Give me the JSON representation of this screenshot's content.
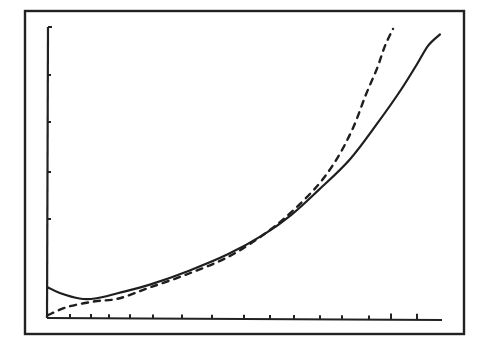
{
  "chart_data": {
    "type": "line",
    "title": "",
    "xlabel": "",
    "ylabel": "",
    "grid": false,
    "legend": null,
    "x_ticks_count": 15,
    "y_ticks_count": 5,
    "xlim": [
      0,
      1
    ],
    "ylim": [
      0,
      1
    ],
    "series": [
      {
        "name": "solid",
        "style": "solid",
        "x": [
          0.0,
          0.03,
          0.08,
          0.12,
          0.18,
          0.26,
          0.36,
          0.46,
          0.55,
          0.62,
          0.69,
          0.77,
          0.84,
          0.9,
          0.94,
          0.97,
          1.0
        ],
        "y": [
          0.11,
          0.09,
          0.07,
          0.07,
          0.09,
          0.12,
          0.17,
          0.23,
          0.3,
          0.37,
          0.46,
          0.57,
          0.7,
          0.82,
          0.91,
          0.98,
          1.02
        ]
      },
      {
        "name": "dashed",
        "style": "dashed",
        "x": [
          0.0,
          0.05,
          0.12,
          0.18,
          0.26,
          0.36,
          0.46,
          0.55,
          0.62,
          0.69,
          0.74,
          0.78,
          0.81,
          0.84,
          0.86,
          0.88
        ],
        "y": [
          0.01,
          0.04,
          0.06,
          0.07,
          0.11,
          0.16,
          0.22,
          0.3,
          0.38,
          0.48,
          0.58,
          0.69,
          0.8,
          0.9,
          0.98,
          1.04
        ]
      }
    ]
  }
}
